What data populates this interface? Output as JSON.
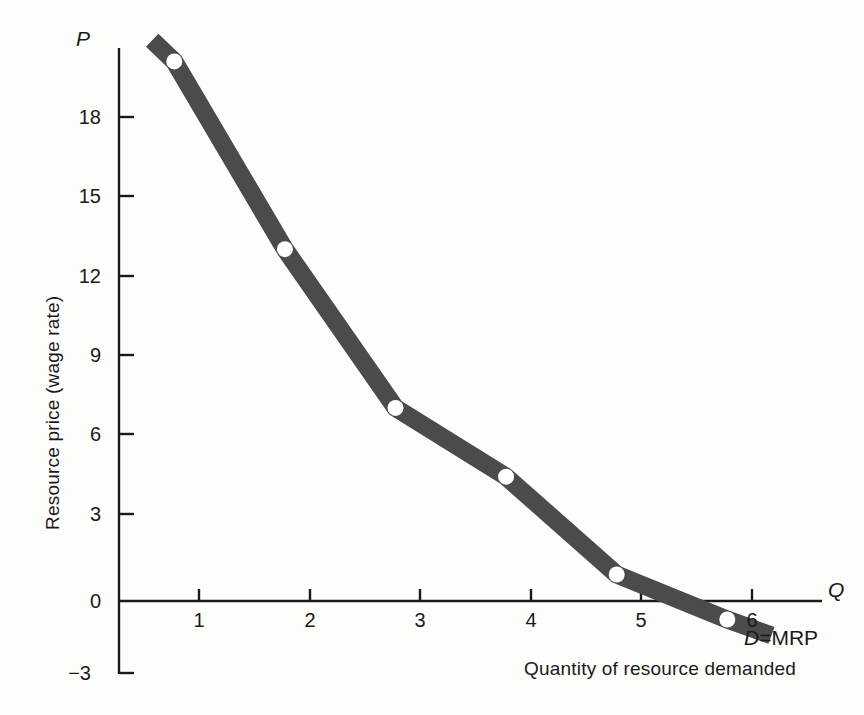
{
  "chart_data": {
    "type": "line",
    "title": "",
    "xlabel": "Quantity of resource demanded",
    "ylabel": "Resource price (wage rate)",
    "x_axis_symbol": "Q",
    "y_axis_symbol": "P",
    "xlim": [
      0,
      6.4
    ],
    "ylim": [
      -3,
      21.5
    ],
    "xticks": [
      1,
      2,
      3,
      4,
      5,
      6
    ],
    "xtick_labels": [
      "1",
      "2",
      "3",
      "4",
      "5",
      "6"
    ],
    "yticks": [
      -3,
      0,
      3,
      6,
      9,
      12,
      15,
      18
    ],
    "ytick_labels": [
      "−3",
      "0",
      "3",
      "6",
      "9",
      "12",
      "15",
      "18"
    ],
    "grid": false,
    "legend": "none",
    "series": [
      {
        "name": "D = MRP",
        "label_prefix": "D",
        "label_operator": "=",
        "label_suffix": "MRP",
        "color": "#4b4b4b",
        "line_width_px": 18,
        "x": [
          0.3,
          0.5,
          1.5,
          2.5,
          3.5,
          4.5,
          5.5,
          5.9
        ],
        "y": [
          21.2,
          20.4,
          13.3,
          7.3,
          4.7,
          1.0,
          -0.7,
          -1.3
        ],
        "markers": {
          "x": [
            0.5,
            1.5,
            2.5,
            3.5,
            4.5,
            5.5
          ],
          "y": [
            20.4,
            13.3,
            7.3,
            4.7,
            1.0,
            -0.7
          ],
          "fill": "#ffffff",
          "shape": "circle"
        }
      }
    ],
    "axis_color": "#1a1a1a",
    "background": "#fdfdfc",
    "zero_crossing_q": 5.05
  }
}
